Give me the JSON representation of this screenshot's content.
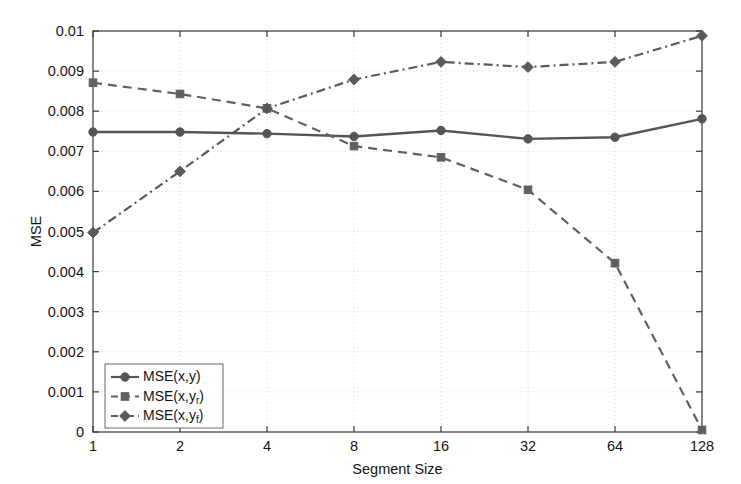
{
  "chart_data": {
    "type": "line",
    "title": "",
    "xlabel": "Segment Size",
    "ylabel": "MSE",
    "x": [
      1,
      2,
      4,
      8,
      16,
      32,
      64,
      128
    ],
    "xtick_labels": [
      "1",
      "2",
      "4",
      "8",
      "16",
      "32",
      "64",
      "128"
    ],
    "x_scale": "log2-categorical",
    "ytick_labels": [
      "0",
      "0.001",
      "0.002",
      "0.003",
      "0.004",
      "0.005",
      "0.006",
      "0.007",
      "0.008",
      "0.009",
      "0.01"
    ],
    "ytick_values": [
      0,
      0.001,
      0.002,
      0.003,
      0.004,
      0.005,
      0.006,
      0.007,
      0.008,
      0.009,
      0.01
    ],
    "ylim": [
      0,
      0.01
    ],
    "grid": true,
    "grid_style": "dotted",
    "legend_position": "lower-left-inside",
    "series": [
      {
        "name": "MSE(x,y)",
        "label_base": "MSE(x,y)",
        "label_sub": "",
        "values": [
          0.00748,
          0.00748,
          0.00744,
          0.00737,
          0.00752,
          0.00731,
          0.00735,
          0.00781
        ],
        "line_style": "solid",
        "marker": "circle",
        "color": "#555555"
      },
      {
        "name": "MSE(x,yr)",
        "label_base": "MSE(x,y",
        "label_sub": "r",
        "values": [
          0.00871,
          0.00843,
          0.00807,
          0.00713,
          0.00685,
          0.00604,
          0.00421,
          5e-05
        ],
        "line_style": "dashed",
        "marker": "square",
        "color": "#606060"
      },
      {
        "name": "MSE(x,yf)",
        "label_base": "MSE(x,y",
        "label_sub": "f",
        "values": [
          0.00497,
          0.0065,
          0.00807,
          0.00879,
          0.00923,
          0.0091,
          0.00923,
          0.00988
        ],
        "line_style": "dashdot",
        "marker": "diamond",
        "color": "#5a5a5a"
      }
    ]
  },
  "plot_geometry": {
    "left": 93,
    "right": 702,
    "top": 31,
    "bottom": 432
  },
  "colors": {
    "axis": "#3a3a3a",
    "grid": "#d8d8d8",
    "text": "#141414",
    "background": "#ffffff",
    "legend_border": "#6a6a6a"
  }
}
